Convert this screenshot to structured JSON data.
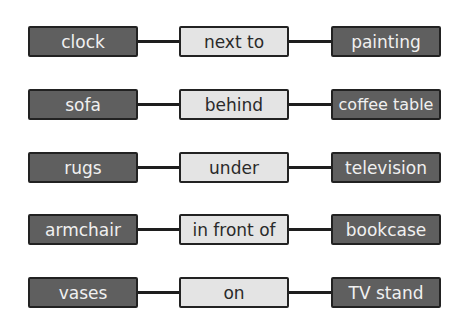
{
  "diagram": {
    "rows": [
      {
        "subject": "clock",
        "relation": "next to",
        "object": "painting"
      },
      {
        "subject": "sofa",
        "relation": "behind",
        "object": "coffee table"
      },
      {
        "subject": "rugs",
        "relation": "under",
        "object": "television"
      },
      {
        "subject": "armchair",
        "relation": "in front of",
        "object": "bookcase"
      },
      {
        "subject": "vases",
        "relation": "on",
        "object": "TV stand"
      }
    ],
    "colors": {
      "object_fill": "#5f5f5f",
      "relation_fill": "#e4e4e4",
      "border": "#222222"
    }
  }
}
